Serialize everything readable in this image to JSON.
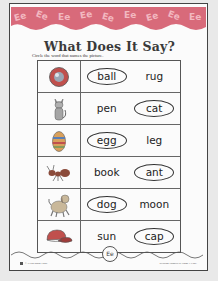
{
  "header": {
    "pattern_letter": "Ee",
    "band_color": "#d86a7a",
    "letter_color": "#f2b8c0"
  },
  "title": "What Does It Say?",
  "instructions": "Circle the word that names the picture.",
  "rows": [
    {
      "picture": "ball-icon",
      "words": [
        "ball",
        "rug"
      ],
      "correct": 0
    },
    {
      "picture": "cat-icon",
      "words": [
        "pen",
        "cat"
      ],
      "correct": 1
    },
    {
      "picture": "egg-icon",
      "words": [
        "egg",
        "leg"
      ],
      "correct": 0
    },
    {
      "picture": "ant-icon",
      "words": [
        "book",
        "ant"
      ],
      "correct": 1
    },
    {
      "picture": "dog-icon",
      "words": [
        "dog",
        "moon"
      ],
      "correct": 0
    },
    {
      "picture": "cap-icon",
      "words": [
        "sun",
        "cap"
      ],
      "correct": 1
    }
  ],
  "footer": {
    "logo": "Ee",
    "left": "© Evan-Moor Corp.",
    "right": "Reading Phonics at Home • EMC"
  }
}
